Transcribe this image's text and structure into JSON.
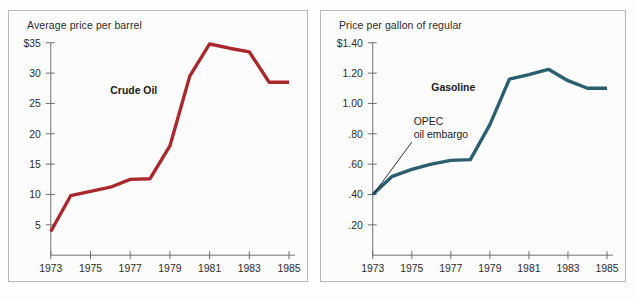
{
  "figure": {
    "background_color": "#fdfdfd",
    "panel_background": "#fcfcfc",
    "border_color": "#b9b9b9"
  },
  "panels": {
    "left": {
      "title": "Average price per barrel",
      "series_label": "Crude Oil",
      "color": "#a8282c"
    },
    "right": {
      "title": "Price per gallon of regular",
      "series_label": "Gasoline",
      "color": "#2b5f70",
      "annotation_line1": "OPEC",
      "annotation_line2": "oil embargo"
    }
  },
  "chart_data": [
    {
      "type": "line",
      "title": "Average price per barrel",
      "series_name": "Crude Oil",
      "color": "#a8282c",
      "xlabel": "",
      "ylabel": "Average price per barrel",
      "x": [
        1973,
        1974,
        1975,
        1976,
        1977,
        1978,
        1979,
        1980,
        1981,
        1982,
        1983,
        1984,
        1985
      ],
      "values": [
        3.9,
        9.8,
        10.5,
        11.2,
        12.5,
        12.6,
        18.0,
        29.5,
        34.8,
        34.1,
        33.5,
        28.5,
        28.5
      ],
      "xlim": [
        1973,
        1985
      ],
      "ylim": [
        0,
        35
      ],
      "xticks": [
        1973,
        1975,
        1977,
        1979,
        1981,
        1983,
        1985
      ],
      "xtick_labels": [
        "1973",
        "1975",
        "1977",
        "1979",
        "1981",
        "1983",
        "1985"
      ],
      "yticks": [
        5,
        10,
        15,
        20,
        25,
        30,
        35
      ],
      "ytick_labels": [
        "5",
        "10",
        "15",
        "20",
        "25",
        "30",
        "$35"
      ],
      "grid": false,
      "legend": "none",
      "annotations": [
        {
          "text": "Crude Oil",
          "x": 1976,
          "y": 26.5
        }
      ]
    },
    {
      "type": "line",
      "title": "Price per gallon of regular",
      "series_name": "Gasoline",
      "color": "#2b5f70",
      "xlabel": "",
      "ylabel": "Price per gallon of regular",
      "x": [
        1973,
        1974,
        1975,
        1976,
        1977,
        1978,
        1979,
        1980,
        1981,
        1982,
        1983,
        1984,
        1985
      ],
      "values": [
        0.4,
        0.52,
        0.565,
        0.6,
        0.625,
        0.63,
        0.86,
        1.16,
        1.19,
        1.225,
        1.15,
        1.1,
        1.1
      ],
      "xlim": [
        1973,
        1985
      ],
      "ylim": [
        0,
        1.4
      ],
      "xticks": [
        1973,
        1975,
        1977,
        1979,
        1981,
        1983,
        1985
      ],
      "xtick_labels": [
        "1973",
        "1975",
        "1977",
        "1979",
        "1981",
        "1983",
        "1985"
      ],
      "yticks": [
        0.2,
        0.4,
        0.6,
        0.8,
        1.0,
        1.2,
        1.4
      ],
      "ytick_labels": [
        ".20",
        ".40",
        ".60",
        ".80",
        "1.00",
        "1.20",
        "$1.40"
      ],
      "grid": false,
      "legend": "none",
      "annotations": [
        {
          "text": "Gasoline",
          "x": 1976,
          "y": 1.08
        },
        {
          "text": "OPEC",
          "x": 1975.1,
          "y": 0.86
        },
        {
          "text": "oil embargo",
          "x": 1975.1,
          "y": 0.775
        }
      ]
    }
  ]
}
